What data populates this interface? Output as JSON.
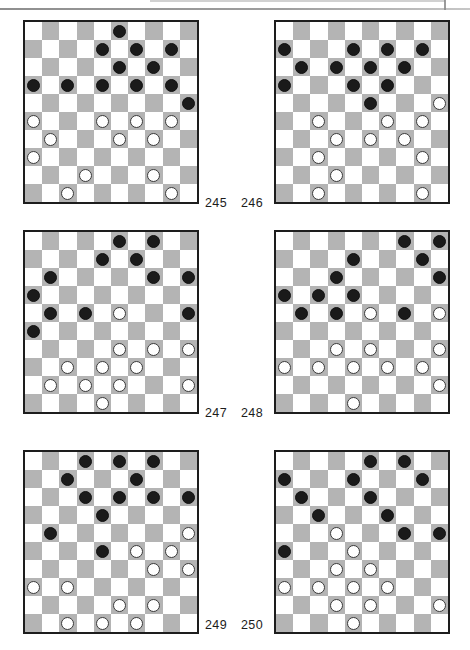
{
  "page": {
    "kind": "draughts-puzzle-diagrams",
    "board_size": 10,
    "colors": {
      "dark_square": "#b4b4b4",
      "light_square": "#ffffff",
      "black_piece": "#1a1a1a",
      "white_piece": "#ffffff",
      "board_border": "#1d1d1d",
      "label_text": "#1c1c1c"
    }
  },
  "label_rows": [
    {
      "left": "245",
      "right": "246"
    },
    {
      "left": "247",
      "right": "248"
    },
    {
      "left": "249",
      "right": "250"
    }
  ],
  "boards": [
    {
      "number": "245",
      "position": "left",
      "row_index": 0,
      "black_count": 12,
      "white_count": 12,
      "black": [
        [
          1,
          6
        ],
        [
          2,
          5
        ],
        [
          2,
          7
        ],
        [
          2,
          9
        ],
        [
          3,
          6
        ],
        [
          3,
          8
        ],
        [
          4,
          1
        ],
        [
          4,
          3
        ],
        [
          4,
          5
        ],
        [
          4,
          7
        ],
        [
          4,
          9
        ],
        [
          5,
          10
        ]
      ],
      "white": [
        [
          6,
          1
        ],
        [
          6,
          5
        ],
        [
          6,
          7
        ],
        [
          6,
          9
        ],
        [
          7,
          2
        ],
        [
          7,
          6
        ],
        [
          7,
          8
        ],
        [
          8,
          1
        ],
        [
          9,
          4
        ],
        [
          9,
          8
        ],
        [
          10,
          3
        ],
        [
          10,
          9
        ]
      ]
    },
    {
      "number": "246",
      "position": "right",
      "row_index": 0,
      "black_count": 12,
      "white_count": 12,
      "black": [
        [
          2,
          1
        ],
        [
          2,
          5
        ],
        [
          2,
          7
        ],
        [
          2,
          9
        ],
        [
          3,
          2
        ],
        [
          3,
          4
        ],
        [
          3,
          6
        ],
        [
          3,
          8
        ],
        [
          4,
          1
        ],
        [
          4,
          5
        ],
        [
          4,
          7
        ],
        [
          5,
          6
        ]
      ],
      "white": [
        [
          5,
          10
        ],
        [
          6,
          3
        ],
        [
          6,
          7
        ],
        [
          6,
          9
        ],
        [
          7,
          4
        ],
        [
          7,
          6
        ],
        [
          7,
          8
        ],
        [
          8,
          3
        ],
        [
          8,
          9
        ],
        [
          9,
          4
        ],
        [
          10,
          3
        ],
        [
          10,
          9
        ]
      ]
    },
    {
      "number": "247",
      "position": "left",
      "row_index": 1,
      "black_count": 12,
      "white_count": 12,
      "black": [
        [
          1,
          6
        ],
        [
          1,
          8
        ],
        [
          2,
          5
        ],
        [
          2,
          7
        ],
        [
          3,
          2
        ],
        [
          3,
          8
        ],
        [
          3,
          10
        ],
        [
          4,
          1
        ],
        [
          5,
          2
        ],
        [
          5,
          4
        ],
        [
          5,
          10
        ],
        [
          6,
          1
        ]
      ],
      "white": [
        [
          5,
          6
        ],
        [
          7,
          6
        ],
        [
          7,
          8
        ],
        [
          7,
          10
        ],
        [
          8,
          3
        ],
        [
          8,
          5
        ],
        [
          8,
          7
        ],
        [
          9,
          2
        ],
        [
          9,
          4
        ],
        [
          9,
          6
        ],
        [
          9,
          10
        ],
        [
          10,
          5
        ]
      ]
    },
    {
      "number": "248",
      "position": "right",
      "row_index": 1,
      "black_count": 12,
      "white_count": 12,
      "black": [
        [
          1,
          8
        ],
        [
          1,
          10
        ],
        [
          2,
          5
        ],
        [
          2,
          9
        ],
        [
          3,
          4
        ],
        [
          3,
          10
        ],
        [
          4,
          1
        ],
        [
          4,
          3
        ],
        [
          4,
          5
        ],
        [
          5,
          2
        ],
        [
          5,
          4
        ],
        [
          5,
          8
        ]
      ],
      "white": [
        [
          5,
          6
        ],
        [
          5,
          10
        ],
        [
          7,
          4
        ],
        [
          7,
          6
        ],
        [
          7,
          10
        ],
        [
          8,
          1
        ],
        [
          8,
          3
        ],
        [
          8,
          5
        ],
        [
          8,
          7
        ],
        [
          8,
          9
        ],
        [
          9,
          10
        ],
        [
          10,
          5
        ]
      ]
    },
    {
      "number": "249",
      "position": "left",
      "row_index": 2,
      "black_count": 12,
      "white_count": 12,
      "black": [
        [
          1,
          4
        ],
        [
          1,
          6
        ],
        [
          1,
          8
        ],
        [
          2,
          3
        ],
        [
          2,
          7
        ],
        [
          3,
          4
        ],
        [
          3,
          6
        ],
        [
          3,
          8
        ],
        [
          3,
          10
        ],
        [
          4,
          5
        ],
        [
          5,
          2
        ],
        [
          6,
          5
        ]
      ],
      "white": [
        [
          5,
          10
        ],
        [
          6,
          7
        ],
        [
          6,
          9
        ],
        [
          7,
          8
        ],
        [
          7,
          10
        ],
        [
          8,
          1
        ],
        [
          8,
          3
        ],
        [
          9,
          6
        ],
        [
          9,
          8
        ],
        [
          10,
          3
        ],
        [
          10,
          5
        ],
        [
          10,
          7
        ]
      ]
    },
    {
      "number": "250",
      "position": "right",
      "row_index": 2,
      "black_count": 12,
      "white_count": 12,
      "black": [
        [
          1,
          6
        ],
        [
          1,
          8
        ],
        [
          2,
          1
        ],
        [
          2,
          5
        ],
        [
          2,
          9
        ],
        [
          3,
          2
        ],
        [
          3,
          6
        ],
        [
          4,
          3
        ],
        [
          4,
          7
        ],
        [
          5,
          8
        ],
        [
          5,
          10
        ],
        [
          6,
          1
        ]
      ],
      "white": [
        [
          5,
          4
        ],
        [
          6,
          5
        ],
        [
          7,
          4
        ],
        [
          7,
          6
        ],
        [
          8,
          1
        ],
        [
          8,
          3
        ],
        [
          8,
          5
        ],
        [
          8,
          7
        ],
        [
          9,
          4
        ],
        [
          9,
          6
        ],
        [
          9,
          10
        ],
        [
          10,
          5
        ]
      ]
    }
  ]
}
